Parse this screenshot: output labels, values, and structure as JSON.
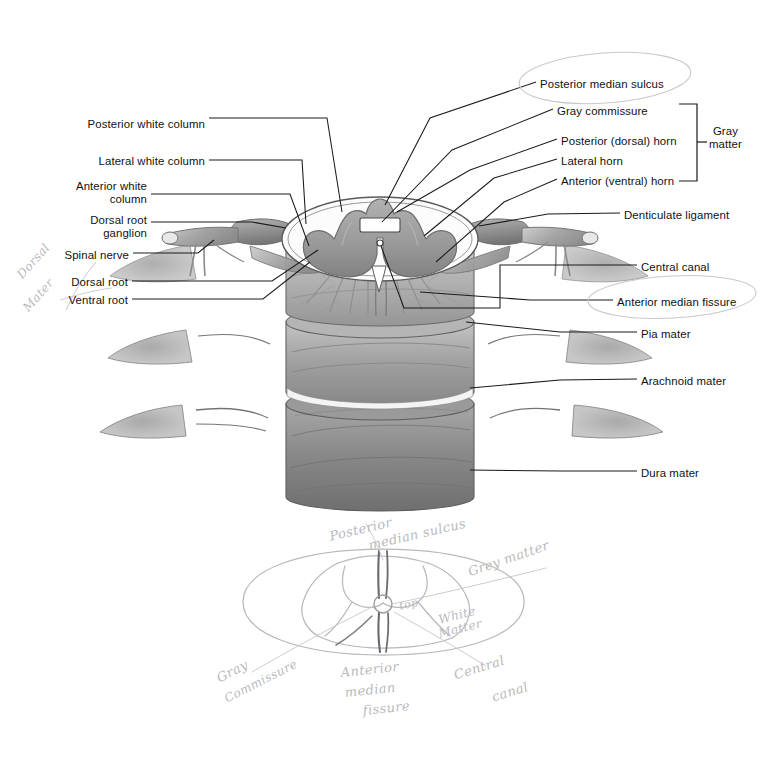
{
  "figure": {
    "type": "anatomical-diagram"
  },
  "labels_left": [
    {
      "id": "posterior-white-column",
      "text": "Posterior white column",
      "x": 83,
      "y": 118,
      "align": "right",
      "w": 122
    },
    {
      "id": "lateral-white-column",
      "text": "Lateral white column",
      "x": 96,
      "y": 155,
      "align": "right",
      "w": 109
    },
    {
      "id": "anterior-white-column",
      "text": "Anterior white\ncolumn",
      "x": 52,
      "y": 180,
      "align": "right",
      "w": 95
    },
    {
      "id": "dorsal-root-ganglion",
      "text": "Dorsal root\nganglion",
      "x": 63,
      "y": 214,
      "align": "right",
      "w": 84
    },
    {
      "id": "spinal-nerve",
      "text": "Spinal nerve",
      "x": 58,
      "y": 249,
      "align": "right",
      "w": 71
    },
    {
      "id": "dorsal-root",
      "text": "Dorsal root",
      "x": 62,
      "y": 276,
      "align": "right",
      "w": 66
    },
    {
      "id": "ventral-root",
      "text": "Ventral root",
      "x": 59,
      "y": 294,
      "align": "right",
      "w": 69
    }
  ],
  "labels_right": [
    {
      "id": "posterior-median-sulcus",
      "text": "Posterior median sulcus",
      "x": 540,
      "y": 78,
      "w": 140
    },
    {
      "id": "gray-commissure",
      "text": "Gray commissure",
      "x": 557,
      "y": 105,
      "w": 100
    },
    {
      "id": "posterior-dorsal-horn",
      "text": "Posterior (dorsal) horn",
      "x": 561,
      "y": 135,
      "w": 126
    },
    {
      "id": "lateral-horn",
      "text": "Lateral horn",
      "x": 561,
      "y": 155,
      "w": 72
    },
    {
      "id": "anterior-ventral-horn",
      "text": "Anterior (ventral) horn",
      "x": 561,
      "y": 175,
      "w": 126
    },
    {
      "id": "denticulate-ligament",
      "text": "Denticulate ligament",
      "x": 624,
      "y": 209,
      "w": 118
    },
    {
      "id": "central-canal",
      "text": "Central canal",
      "x": 641,
      "y": 261,
      "w": 80
    },
    {
      "id": "anterior-median-fissure",
      "text": "Anterior median fissure",
      "x": 617,
      "y": 296,
      "w": 137
    },
    {
      "id": "pia-mater",
      "text": "Pia mater",
      "x": 641,
      "y": 328,
      "w": 58
    },
    {
      "id": "arachnoid-mater",
      "text": "Arachnoid mater",
      "x": 641,
      "y": 375,
      "w": 96
    },
    {
      "id": "dura-mater",
      "text": "Dura mater",
      "x": 641,
      "y": 467,
      "w": 66
    }
  ],
  "bracket": {
    "id": "gray-matter-bracket",
    "label": "Gray\nmatter",
    "x": 709,
    "y": 125,
    "top": 104,
    "bottom": 181,
    "line_x": 697,
    "tick_x": 687
  },
  "handwriting_main": [
    {
      "id": "hw-dorsal",
      "text": "Dorsal",
      "x": 14,
      "y": 272,
      "rot": -48,
      "size": 12
    },
    {
      "id": "hw-mater",
      "text": "Mater",
      "x": 20,
      "y": 305,
      "rot": -48,
      "size": 12
    }
  ],
  "handwriting_sketch": [
    {
      "id": "hw-posterior-median-sulcus",
      "text": "Posterior",
      "x": 328,
      "y": 529,
      "rot": -13,
      "size": 13
    },
    {
      "id": "hw-posterior-median-sulcus2",
      "text": "median sulcus",
      "x": 367,
      "y": 538,
      "rot": -13,
      "size": 13
    },
    {
      "id": "hw-grey-matter",
      "text": "Grey matter",
      "x": 466,
      "y": 565,
      "rot": -19,
      "size": 13
    },
    {
      "id": "hw-white-matter",
      "text": "White",
      "x": 437,
      "y": 613,
      "rot": -14,
      "size": 12
    },
    {
      "id": "hw-white-matter2",
      "text": "Matter",
      "x": 437,
      "y": 627,
      "rot": -14,
      "size": 12
    },
    {
      "id": "hw-top",
      "text": "top",
      "x": 398,
      "y": 600,
      "rot": -12,
      "size": 11
    },
    {
      "id": "hw-gray-commissure",
      "text": "Gray",
      "x": 214,
      "y": 672,
      "rot": -27,
      "size": 13
    },
    {
      "id": "hw-gray-commissure2",
      "text": "Commissure",
      "x": 222,
      "y": 693,
      "rot": -27,
      "size": 12
    },
    {
      "id": "hw-anterior-median-fissure",
      "text": "Anterior",
      "x": 340,
      "y": 665,
      "rot": -6,
      "size": 13
    },
    {
      "id": "hw-anterior-median-fissure2",
      "text": "median",
      "x": 344,
      "y": 685,
      "rot": -6,
      "size": 13
    },
    {
      "id": "hw-anterior-median-fissure3",
      "text": "fissure",
      "x": 362,
      "y": 703,
      "rot": -6,
      "size": 13
    },
    {
      "id": "hw-central-canal",
      "text": "Central",
      "x": 452,
      "y": 668,
      "rot": -17,
      "size": 13
    },
    {
      "id": "hw-central-canal2",
      "text": "canal",
      "x": 490,
      "y": 690,
      "rot": -17,
      "size": 13
    }
  ],
  "colors": {
    "ink": "#111111",
    "leader": "#1a1a1a",
    "gray_matter": "#9a9a9a",
    "gray_matter_dark": "#808080",
    "white_matter": "#fbfbfb",
    "pia": "#b9b9b9",
    "arachnoid": "#a0a0a0",
    "dura": "#8a8a8a",
    "nerve": "#9d9d9d",
    "pencil": "#c2c2c6",
    "outline": "#3a3a3a"
  }
}
